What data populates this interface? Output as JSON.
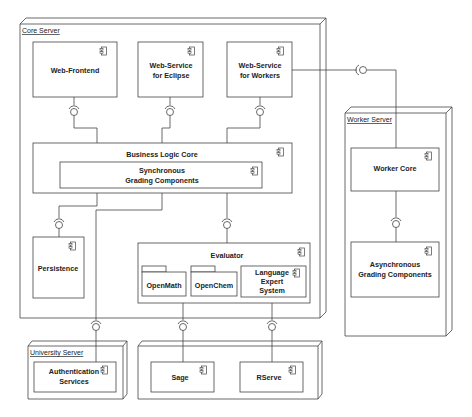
{
  "diagram": {
    "type": "UML deployment diagram",
    "nodes": {
      "core_server": {
        "label": "Core Server"
      },
      "worker_server": {
        "label": "Worker Server"
      },
      "university_server": {
        "label": "University Server"
      },
      "external_server": {
        "label": ""
      }
    },
    "components": {
      "web_frontend": {
        "label": "Web-Frontend"
      },
      "ws_eclipse": {
        "line1": "Web-Service",
        "line2": "for Eclipse"
      },
      "ws_workers": {
        "line1": "Web-Service",
        "line2": "for Workers"
      },
      "business_logic_core": {
        "label": "Business Logic Core"
      },
      "sync_grading": {
        "line1": "Synchronous",
        "line2": "Grading Components"
      },
      "persistence": {
        "label": "Persistence"
      },
      "evaluator": {
        "label": "Evaluator"
      },
      "openmath": {
        "label": "OpenMath"
      },
      "openchem": {
        "label": "OpenChem"
      },
      "language_expert": {
        "line1": "Language",
        "line2": "Expert",
        "line3": "System"
      },
      "worker_core": {
        "label": "Worker Core"
      },
      "async_grading": {
        "line1": "Asynchronous",
        "line2": "Grading Components"
      },
      "auth_services": {
        "line1": "Authentication",
        "line2": "Services"
      },
      "sage": {
        "label": "Sage"
      },
      "rserve": {
        "label": "RServe"
      }
    },
    "connections": [
      {
        "from": "Web-Frontend",
        "to": "Business Logic Core",
        "type": "interface"
      },
      {
        "from": "Web-Service for Eclipse",
        "to": "Business Logic Core",
        "type": "interface"
      },
      {
        "from": "Web-Service for Workers",
        "to": "Business Logic Core",
        "type": "interface"
      },
      {
        "from": "Web-Service for Workers",
        "to": "Worker Core",
        "type": "interface"
      },
      {
        "from": "Worker Core",
        "to": "Asynchronous Grading Components",
        "type": "interface"
      },
      {
        "from": "Business Logic Core",
        "to": "Persistence",
        "type": "interface"
      },
      {
        "from": "Business Logic Core",
        "to": "Evaluator",
        "type": "interface"
      },
      {
        "from": "Business Logic Core",
        "to": "Authentication Services",
        "type": "interface"
      },
      {
        "from": "OpenMath",
        "to": "Sage",
        "type": "interface"
      },
      {
        "from": "Language Expert System",
        "to": "RServe",
        "type": "interface"
      }
    ]
  }
}
